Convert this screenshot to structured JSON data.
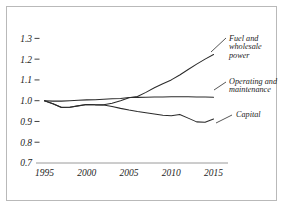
{
  "figure": {
    "top_fragment": "",
    "background_color": "#ffffff",
    "frame_color": "#b9b9b9",
    "line_color": "#2b2b2b",
    "axis_color": "#9a9a9a"
  },
  "chart_data": {
    "type": "line",
    "title": "",
    "subtitle": "",
    "xlabel": "",
    "ylabel": "",
    "xlim": [
      1994,
      2016
    ],
    "ylim": [
      0.7,
      1.35
    ],
    "yticks": [
      0.7,
      0.8,
      0.9,
      1.0,
      1.1,
      1.2,
      1.3
    ],
    "ytick_labels": [
      "0.7",
      "0.8",
      "0.9",
      "1.0",
      "1.1",
      "1.2",
      "1.3"
    ],
    "xticks": [
      1995,
      2000,
      2005,
      2010,
      2015
    ],
    "xtick_labels": [
      "1995",
      "2000",
      "2005",
      "2010",
      "2015"
    ],
    "grid": false,
    "legend_position": "inline-right-labels",
    "baseline_year": 1995,
    "baseline_value": 1.0,
    "x": [
      1995,
      1996,
      1997,
      1998,
      1999,
      2000,
      2001,
      2002,
      2003,
      2004,
      2005,
      2006,
      2007,
      2008,
      2009,
      2010,
      2011,
      2012,
      2013,
      2014,
      2015
    ],
    "series": [
      {
        "name": "Fuel and wholesale power",
        "label_lines": [
          "Fuel and",
          "wholesale",
          "power"
        ],
        "values": [
          1.0,
          0.985,
          0.968,
          0.968,
          0.975,
          0.982,
          0.98,
          0.98,
          0.988,
          1.0,
          1.014,
          1.02,
          1.04,
          1.062,
          1.082,
          1.1,
          1.124,
          1.15,
          1.176,
          1.2,
          1.222
        ]
      },
      {
        "name": "Operating and maintenance",
        "label_lines": [
          "Operating and",
          "maintenance"
        ],
        "values": [
          1.0,
          0.998,
          0.998,
          1.0,
          1.002,
          1.004,
          1.005,
          1.007,
          1.009,
          1.011,
          1.015,
          1.016,
          1.017,
          1.018,
          1.018,
          1.019,
          1.019,
          1.019,
          1.018,
          1.018,
          1.017
        ]
      },
      {
        "name": "Capital",
        "label_lines": [
          "Capital"
        ],
        "values": [
          1.0,
          0.985,
          0.967,
          0.968,
          0.976,
          0.982,
          0.98,
          0.979,
          0.972,
          0.963,
          0.955,
          0.948,
          0.942,
          0.936,
          0.93,
          0.928,
          0.934,
          0.916,
          0.898,
          0.896,
          0.912
        ]
      }
    ]
  }
}
